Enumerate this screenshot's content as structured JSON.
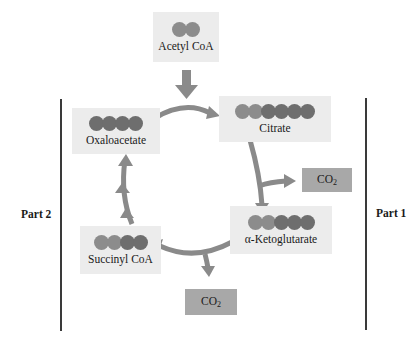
{
  "diagram": {
    "molecules": [
      {
        "id": "acetyl-coa",
        "label": "Acetyl CoA",
        "dots": [
          "light",
          "light"
        ]
      },
      {
        "id": "citrate",
        "label": "Citrate",
        "dots": [
          "light",
          "light",
          "dark",
          "dark",
          "dark",
          "dark"
        ]
      },
      {
        "id": "alpha-ketoglutarate",
        "label": "α-Ketoglutarate",
        "dots": [
          "light",
          "light",
          "dark",
          "dark",
          "dark"
        ]
      },
      {
        "id": "succinyl-coa",
        "label": "Succinyl CoA",
        "dots": [
          "light",
          "light",
          "dark",
          "dark"
        ]
      },
      {
        "id": "oxaloacetate",
        "label": "Oxaloacetate",
        "dots": [
          "dark",
          "dark",
          "dark",
          "dark"
        ]
      }
    ],
    "co2": [
      {
        "id": "co2-1",
        "main": "CO",
        "sub": "2"
      },
      {
        "id": "co2-2",
        "main": "CO",
        "sub": "2"
      }
    ],
    "parts": {
      "left": "Part 2",
      "right": "Part 1"
    },
    "colors": {
      "box_bg": "#ececec",
      "co2_bg": "#a8a8a8",
      "arrow": "#8a8a8a",
      "dot_light": "#8c8c8c",
      "dot_dark": "#6e6e6e"
    }
  }
}
